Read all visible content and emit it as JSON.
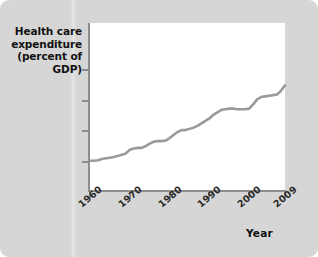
{
  "figure": {
    "background_color": "#d6d6d6",
    "plot_background_color": "#ffffff",
    "axis_color": "#8d8d8d",
    "line_color": "#9a9a9a"
  },
  "axis_titles": {
    "y_line1": "Health care",
    "y_line2": "expenditure",
    "y_line3": "(percent of GDP)",
    "x": "Year"
  },
  "chart_data": {
    "type": "line",
    "title": "",
    "xlabel": "Year",
    "ylabel": "Health care expenditure (percent of GDP)",
    "xlim": [
      1960,
      2009
    ],
    "ylim": [
      0,
      21.5
    ],
    "grid": false,
    "legend": null,
    "ytick_labels": [
      "20%",
      "15",
      "10",
      "5"
    ],
    "ytick_values": [
      20,
      15,
      10,
      5
    ],
    "xtick_labels": [
      "1960",
      "1970",
      "1980",
      "1990",
      "2000",
      "2009"
    ],
    "xtick_values": [
      1960,
      1970,
      1980,
      1990,
      2000,
      2009
    ],
    "series": [
      {
        "name": "Health care expenditure (percent of GDP)",
        "x": [
          1960,
          1961,
          1962,
          1963,
          1964,
          1965,
          1966,
          1967,
          1968,
          1969,
          1970,
          1971,
          1972,
          1973,
          1974,
          1975,
          1976,
          1977,
          1978,
          1979,
          1980,
          1981,
          1982,
          1983,
          1984,
          1985,
          1986,
          1987,
          1988,
          1989,
          1990,
          1991,
          1992,
          1993,
          1994,
          1995,
          1996,
          1997,
          1998,
          1999,
          2000,
          2001,
          2002,
          2003,
          2004,
          2005,
          2006,
          2007,
          2008,
          2009
        ],
        "values": [
          5.2,
          5.2,
          5.3,
          5.5,
          5.6,
          5.7,
          5.8,
          6.0,
          6.2,
          6.4,
          7.0,
          7.2,
          7.3,
          7.3,
          7.6,
          8.0,
          8.3,
          8.4,
          8.4,
          8.5,
          8.9,
          9.4,
          9.9,
          10.2,
          10.2,
          10.4,
          10.6,
          10.9,
          11.3,
          11.7,
          12.1,
          12.7,
          13.1,
          13.5,
          13.6,
          13.7,
          13.7,
          13.6,
          13.6,
          13.6,
          13.7,
          14.4,
          15.2,
          15.6,
          15.7,
          15.8,
          15.9,
          16.0,
          16.6,
          17.5
        ]
      }
    ]
  }
}
